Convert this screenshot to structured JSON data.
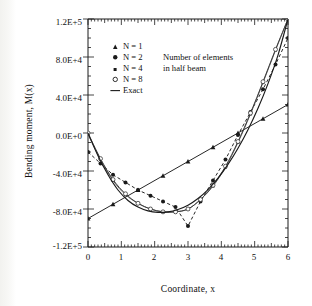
{
  "chart_data": {
    "type": "line",
    "title": "",
    "xlabel": "Coordinate, x",
    "ylabel": "Bending moment, M(x)",
    "xlim": [
      0,
      6
    ],
    "ylim": [
      -120000,
      120000
    ],
    "xticks": [
      "0",
      "1",
      "2",
      "3",
      "4",
      "5",
      "6"
    ],
    "xtick_values": [
      0,
      1,
      2,
      3,
      4,
      5,
      6
    ],
    "yticks": [
      "1.2E+5",
      "8.0E+4",
      "4.0E+4",
      "0.0E+0",
      "-4.0E+4",
      "-8.0E+4",
      "-1.2E+5"
    ],
    "ytick_values": [
      120000,
      80000,
      40000,
      0,
      -40000,
      -80000,
      -120000
    ],
    "grid": false,
    "minor_ticks": true,
    "legend_position": "upper-left-inside",
    "annotation": {
      "line1": "Number of elements",
      "line2": "in half beam"
    },
    "series": [
      {
        "name": "N = 1",
        "label": "N = 1",
        "marker": "triangle-filled",
        "linestyle": "solid",
        "color": "#1a1a1a",
        "x": [
          0,
          0.75,
          1.5,
          2.25,
          3.0,
          3.75,
          4.5,
          5.25,
          6.0
        ],
        "y": [
          -90000,
          -75000,
          -60000,
          -45000,
          -30000,
          -15000,
          0,
          15000,
          30000
        ]
      },
      {
        "name": "N = 2",
        "label": "N = 2",
        "marker": "circle-filled",
        "linestyle": "dashed",
        "color": "#1a1a1a",
        "x": [
          0,
          0.375,
          0.75,
          1.125,
          1.5,
          1.875,
          2.25,
          2.625,
          3.0,
          3.375,
          3.75,
          4.125,
          4.5,
          4.875,
          5.25,
          5.625,
          6.0
        ],
        "y": [
          -20000,
          -32000,
          -44000,
          -52000,
          -60000,
          -66000,
          -72000,
          -78000,
          -98000,
          -72000,
          -50000,
          -28000,
          -2000,
          22000,
          46000,
          72000,
          100000
        ]
      },
      {
        "name": "N = 4",
        "label": "N = 4",
        "marker": "square-small",
        "linestyle": "solid",
        "color": "#5a5a5a",
        "x": [
          0,
          0.375,
          0.75,
          1.125,
          1.5,
          1.875,
          2.25,
          2.625,
          3.0,
          3.375,
          3.75,
          4.125,
          4.5,
          4.875,
          5.25,
          5.625,
          6.0
        ],
        "y": [
          -1500,
          -28000,
          -50000,
          -65000,
          -74000,
          -80000,
          -83000,
          -83000,
          -80000,
          -70000,
          -56000,
          -36000,
          -10000,
          20000,
          53000,
          87000,
          120000
        ]
      },
      {
        "name": "N = 8",
        "label": "N = 8",
        "marker": "circle-open",
        "linestyle": "solid",
        "color": "#3a3a3a",
        "x": [
          0,
          0.375,
          0.75,
          1.125,
          1.5,
          1.875,
          2.25,
          2.625,
          3.0,
          3.375,
          3.75,
          4.125,
          4.5,
          4.875,
          5.25,
          5.625,
          6.0
        ],
        "y": [
          0,
          -27000,
          -49000,
          -64000,
          -74000,
          -80000,
          -83000,
          -83000,
          -80000,
          -70000,
          -55000,
          -35000,
          -9000,
          21000,
          54000,
          88000,
          120000
        ]
      },
      {
        "name": "Exact",
        "label": "Exact",
        "marker": "none",
        "linestyle": "solid",
        "color": "#1a1a1a",
        "x": [
          0,
          0.3,
          0.6,
          0.9,
          1.2,
          1.5,
          1.8,
          2.1,
          2.4,
          2.7,
          3.0,
          3.3,
          3.6,
          3.9,
          4.2,
          4.5,
          4.8,
          5.1,
          5.4,
          5.7,
          6.0
        ],
        "y": [
          0,
          -24000,
          -44000,
          -60000,
          -71000,
          -78000,
          -82000,
          -83500,
          -83000,
          -80500,
          -76000,
          -69000,
          -59500,
          -47500,
          -33000,
          -16000,
          3500,
          26000,
          52000,
          82000,
          120000
        ]
      }
    ]
  },
  "legend": {
    "items": [
      {
        "label_prefix": "N",
        "label_eq": "= 1",
        "marker": "triangle-filled"
      },
      {
        "label_prefix": "N",
        "label_eq": "= 2",
        "marker": "circle-filled"
      },
      {
        "label_prefix": "N",
        "label_eq": "= 4",
        "marker": "square-small"
      },
      {
        "label_prefix": "N",
        "label_eq": "= 8",
        "marker": "circle-open"
      },
      {
        "label_prefix": "",
        "label_eq": "Exact",
        "marker": "line"
      }
    ],
    "entry_0": "N = 1",
    "entry_1": "N = 2",
    "entry_2": "N = 4",
    "entry_3": "N = 8",
    "entry_4": "Exact"
  }
}
